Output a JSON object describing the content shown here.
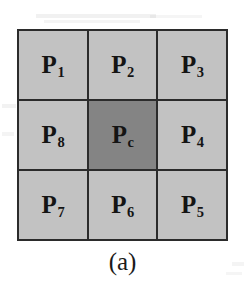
{
  "figure": {
    "caption": "(a)",
    "colors": {
      "neighbor_fill": "#c2c2c2",
      "center_fill": "#848484",
      "border": "#2b2b2b",
      "label_text": "#141414",
      "background": "#ffffff"
    },
    "grid": {
      "rows": 3,
      "columns": 3,
      "cells": [
        {
          "symbol": "P",
          "subscript": "1",
          "label": "P1",
          "role": "neighbor",
          "position": "top-left"
        },
        {
          "symbol": "P",
          "subscript": "2",
          "label": "P2",
          "role": "neighbor",
          "position": "top-center"
        },
        {
          "symbol": "P",
          "subscript": "3",
          "label": "P3",
          "role": "neighbor",
          "position": "top-right"
        },
        {
          "symbol": "P",
          "subscript": "8",
          "label": "P8",
          "role": "neighbor",
          "position": "middle-left"
        },
        {
          "symbol": "P",
          "subscript": "c",
          "label": "Pc",
          "role": "center",
          "position": "middle-center"
        },
        {
          "symbol": "P",
          "subscript": "4",
          "label": "P4",
          "role": "neighbor",
          "position": "middle-right"
        },
        {
          "symbol": "P",
          "subscript": "7",
          "label": "P7",
          "role": "neighbor",
          "position": "bottom-left"
        },
        {
          "symbol": "P",
          "subscript": "6",
          "label": "P6",
          "role": "neighbor",
          "position": "bottom-center"
        },
        {
          "symbol": "P",
          "subscript": "5",
          "label": "P5",
          "role": "neighbor",
          "position": "bottom-right"
        }
      ]
    }
  }
}
